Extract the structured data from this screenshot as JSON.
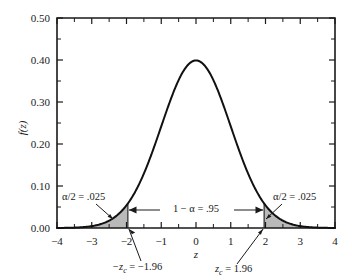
{
  "chart_data": {
    "type": "line",
    "title": "",
    "xlabel": "z",
    "ylabel": "f(z)",
    "xlim": [
      -4,
      4
    ],
    "ylim": [
      0.0,
      0.5
    ],
    "grid": false,
    "legend": "none",
    "x_ticks": [
      "-4",
      "-3",
      "-2",
      "-1",
      "0",
      "1",
      "2",
      "3",
      "4"
    ],
    "x_tick_values": [
      -4,
      -3,
      -2,
      -1,
      0,
      1,
      2,
      3,
      4
    ],
    "x_minor_step": 0.5,
    "y_ticks": [
      "0.00",
      "0.10",
      "0.20",
      "0.30",
      "0.40",
      "0.50"
    ],
    "y_tick_values": [
      0.0,
      0.1,
      0.2,
      0.3,
      0.4,
      0.5
    ],
    "y_minor_step": 0.05,
    "series": [
      {
        "name": "standard normal density",
        "formula": "f(z) = (1/sqrt(2*pi)) * exp(-z^2/2)",
        "peak_x": 0,
        "peak_y": 0.3989,
        "x": [
          -4.0,
          -3.5,
          -3.0,
          -2.5,
          -2.0,
          -1.96,
          -1.5,
          -1.0,
          -0.5,
          0.0,
          0.5,
          1.0,
          1.5,
          1.96,
          2.0,
          2.5,
          3.0,
          3.5,
          4.0
        ],
        "values": [
          0.0001,
          0.0009,
          0.0044,
          0.0175,
          0.054,
          0.0584,
          0.1295,
          0.242,
          0.3521,
          0.3989,
          0.3521,
          0.242,
          0.1295,
          0.0584,
          0.054,
          0.0175,
          0.0044,
          0.0009,
          0.0001
        ]
      }
    ],
    "shaded_regions": [
      {
        "name": "left-tail",
        "from": -4.0,
        "to": -1.96,
        "area": 0.025,
        "color": "#b9b9b9"
      },
      {
        "name": "right-tail",
        "from": 1.96,
        "to": 4.0,
        "area": 0.025,
        "color": "#b9b9b9"
      }
    ],
    "critical_values": [
      -1.96,
      1.96
    ],
    "annotations": [
      {
        "name": "alpha-left",
        "text": "α/2 = .025",
        "points_to_x": -2.3
      },
      {
        "name": "alpha-right",
        "text": "α/2 = .025",
        "points_to_x": 2.3
      },
      {
        "name": "confidence",
        "text": "1 − α = .95",
        "span": [
          -1.96,
          1.96
        ]
      },
      {
        "name": "z-critical-left",
        "text": "−z_c = −1.96",
        "points_to_x": -1.96
      },
      {
        "name": "z-critical-right",
        "text": "z_c = 1.96",
        "points_to_x": 1.96
      }
    ]
  },
  "labels": {
    "y_axis_title": "f(z)",
    "x_axis_title": "z",
    "alpha_left": "α/2 = .025",
    "alpha_right": "α/2 = .025",
    "confidence": "1 − α = .95",
    "zc_left_prefix": "−z",
    "zc_left_sub": "c",
    "zc_left_value": " = −1.96",
    "zc_right_prefix": "z",
    "zc_right_sub": "c",
    "zc_right_value": " = 1.96",
    "y0": "0.00",
    "y1": "0.10",
    "y2": "0.20",
    "y3": "0.30",
    "y4": "0.40",
    "y5": "0.50",
    "x0": "−4",
    "x1": "−3",
    "x2": "−2",
    "x3": "−1",
    "x4": "0",
    "x5": "1",
    "x6": "2",
    "x7": "3",
    "x8": "4"
  },
  "colors": {
    "shade": "#b9b9b9",
    "curve": "#111111",
    "axis": "#1a1a1a",
    "background": "#ffffff"
  }
}
